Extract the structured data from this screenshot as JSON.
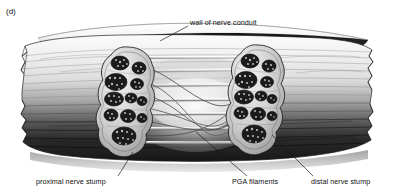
{
  "figure": {
    "panel_letter": "(d)",
    "domain": "biomedical-illustration",
    "style": "grayscale pen-and-ink / airbrush anatomical illustration",
    "background_color": "#ffffff"
  },
  "labels": {
    "wall": "wall of nerve conduit",
    "proximal": "proximal nerve stump",
    "pga": "PGA filaments",
    "distal": "distal nerve stump"
  },
  "palette": {
    "ink": "#111111",
    "conduit_top_highlight": "#f2f2f2",
    "conduit_mid": "#bdbdbd",
    "conduit_bottom_shadow": "#1a1a1a",
    "interior_dark": "#2a2a2a",
    "interior_glow": "#e8e8e8",
    "stump_sheath": "#d8d8d8",
    "fascicle_fill": "#1d1d1d",
    "filament": "#d5d5d5",
    "shadow_base": "#b0b0b0",
    "outline": "#2b2b2b"
  },
  "structures": {
    "conduit": {
      "name": "nerve conduit tube",
      "description": "hollow cylinder shown in cut-away, light gray on top grading to near-black at bottom, torn irregular edges at both ends",
      "left_end_x": 22,
      "right_end_x": 372,
      "top_y": 37,
      "bottom_y": 160
    },
    "proximal_stump": {
      "name": "proximal nerve stump cross-section",
      "center_x": 128,
      "center_y": 102,
      "rx": 26,
      "ry": 55,
      "fascicle_count": 11
    },
    "distal_stump": {
      "name": "distal nerve stump cross-section",
      "center_x": 258,
      "center_y": 100,
      "rx": 26,
      "ry": 55,
      "fascicle_count": 11
    },
    "pga_filaments": {
      "name": "PGA filament bundle",
      "description": "straight pale longitudinal filaments spanning the gap between the two stumps",
      "count": 7,
      "span_x": [
        130,
        258
      ]
    },
    "regenerating_fibers": {
      "name": "regenerating nerve fibers",
      "description": "curving dark fibers growing from proximal toward distal stump along the filaments",
      "count": 6
    }
  },
  "leader_lines": [
    {
      "name": "wall-leader",
      "from": [
        188,
        26
      ],
      "to": [
        160,
        41
      ]
    },
    {
      "name": "proximal-leader",
      "from": [
        118,
        176
      ],
      "to": [
        133,
        152
      ]
    },
    {
      "name": "pga-leader",
      "from": [
        247,
        176
      ],
      "to": [
        196,
        132
      ]
    },
    {
      "name": "distal-leader",
      "from": [
        313,
        176
      ],
      "to": [
        272,
        135
      ]
    }
  ]
}
